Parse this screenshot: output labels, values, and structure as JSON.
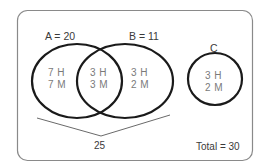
{
  "diagram": {
    "type": "venn",
    "colors": {
      "frame": "#8a8a8a",
      "outline": "#1a1a1a",
      "label": "#3a3a3a",
      "region_text": "#7a7a7a"
    },
    "sets": [
      {
        "id": "A",
        "label": "A = 20"
      },
      {
        "id": "B",
        "label": "B = 11"
      },
      {
        "id": "C",
        "label": "C"
      }
    ],
    "regions": {
      "a_only": {
        "line1": "7 H",
        "line2": "7 M"
      },
      "a_and_b": {
        "line1": "3 H",
        "line2": "3 M"
      },
      "b_only": {
        "line1": "3 H",
        "line2": "2 M"
      },
      "c_only": {
        "line1": "3 H",
        "line2": "2 M"
      }
    },
    "union_bracket": {
      "label": "25"
    },
    "total": {
      "label": "Total = 30"
    }
  }
}
